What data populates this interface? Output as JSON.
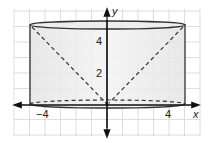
{
  "diagram": {
    "type": "cone inscribed in cylinder on coordinate grid",
    "axes": {
      "x_label": "x",
      "y_label": "y",
      "x_ticks": [
        {
          "value": -4,
          "label": "−4"
        },
        {
          "value": 4,
          "label": "4"
        }
      ],
      "y_ticks": [
        {
          "value": 2,
          "label": "2"
        },
        {
          "value": 4,
          "label": "4"
        }
      ]
    },
    "cylinder": {
      "radius": 5,
      "height": 5.2,
      "fill": "#e6e6e6",
      "stroke": "#333333"
    },
    "cone": {
      "apex": [
        0,
        0
      ],
      "base_height": 5.2,
      "base_radius": 5,
      "style": "dashed"
    },
    "grid": {
      "color": "#d4d4d4",
      "spacing_units": 1
    }
  }
}
